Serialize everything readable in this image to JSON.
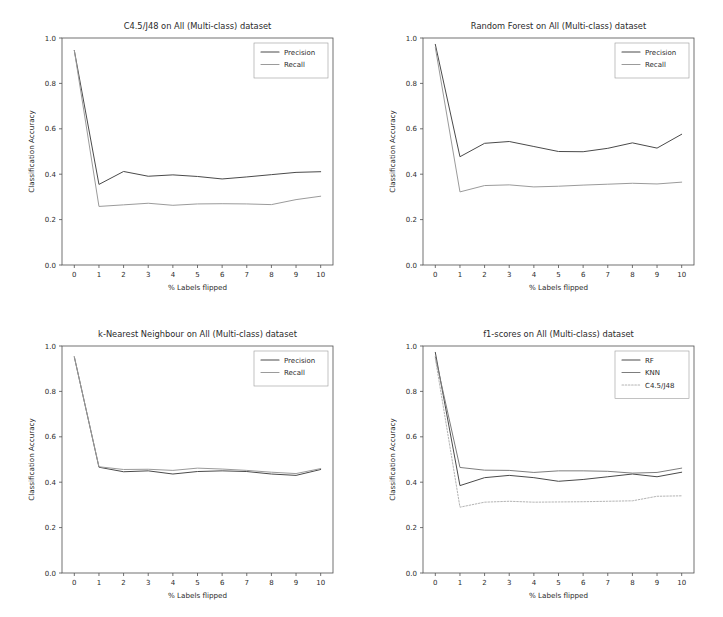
{
  "figure": {
    "background_color": "#ffffff",
    "rows": 2,
    "cols": 2
  },
  "axis": {
    "xlabel": "% Labels flipped",
    "ylabel": "Classification Accuracy",
    "xticks": [
      "0",
      "1",
      "2",
      "3",
      "4",
      "5",
      "6",
      "7",
      "8",
      "9",
      "10"
    ],
    "yticks": [
      "0.0",
      "0.2",
      "0.4",
      "0.6",
      "0.8",
      "1.0"
    ]
  },
  "colors": {
    "precision": "#4a4a4a",
    "recall": "#9b9b9b",
    "rf": "#4a4a4a",
    "knn": "#7d7d7d",
    "c45": "#b4b4b4",
    "spine": "#4f4f4f",
    "text": "#2b2b2b"
  },
  "chart_data": [
    {
      "type": "line",
      "title": "C4.5/J48 on All (Multi-class) dataset",
      "xlabel": "% Labels flipped",
      "ylabel": "Classification Accuracy",
      "x": [
        0,
        1,
        2,
        3,
        4,
        5,
        6,
        7,
        8,
        9,
        10
      ],
      "xlim": [
        -0.5,
        10.5
      ],
      "ylim": [
        0.0,
        1.0
      ],
      "grid": false,
      "legend_position": "upper right",
      "series": [
        {
          "name": "Precision",
          "color": "#4a4a4a",
          "style": "solid",
          "values": [
            0.945,
            0.355,
            0.412,
            0.391,
            0.397,
            0.39,
            0.379,
            0.388,
            0.398,
            0.408,
            0.411
          ]
        },
        {
          "name": "Recall",
          "color": "#9b9b9b",
          "style": "solid",
          "values": [
            0.945,
            0.258,
            0.265,
            0.272,
            0.263,
            0.269,
            0.27,
            0.269,
            0.266,
            0.288,
            0.303
          ]
        }
      ]
    },
    {
      "type": "line",
      "title": "Random Forest on All (Multi-class) dataset",
      "xlabel": "% Labels flipped",
      "ylabel": "Classification Accuracy",
      "x": [
        0,
        1,
        2,
        3,
        4,
        5,
        6,
        7,
        8,
        9,
        10
      ],
      "xlim": [
        -0.5,
        10.5
      ],
      "ylim": [
        0.0,
        1.0
      ],
      "grid": false,
      "legend_position": "upper right",
      "series": [
        {
          "name": "Precision",
          "color": "#4a4a4a",
          "style": "solid",
          "values": [
            0.972,
            0.477,
            0.536,
            0.544,
            0.522,
            0.5,
            0.499,
            0.514,
            0.538,
            0.515,
            0.576
          ]
        },
        {
          "name": "Recall",
          "color": "#9b9b9b",
          "style": "solid",
          "values": [
            0.958,
            0.322,
            0.35,
            0.353,
            0.344,
            0.347,
            0.352,
            0.356,
            0.36,
            0.357,
            0.365
          ]
        }
      ]
    },
    {
      "type": "line",
      "title": "k-Nearest Neighbour on All (Multi-class) dataset",
      "xlabel": "% Labels flipped",
      "ylabel": "Classification Accuracy",
      "x": [
        0,
        1,
        2,
        3,
        4,
        5,
        6,
        7,
        8,
        9,
        10
      ],
      "xlim": [
        -0.5,
        10.5
      ],
      "ylim": [
        0.0,
        1.0
      ],
      "grid": false,
      "legend_position": "upper right",
      "series": [
        {
          "name": "Precision",
          "color": "#4a4a4a",
          "style": "solid",
          "values": [
            0.952,
            0.466,
            0.446,
            0.45,
            0.436,
            0.447,
            0.45,
            0.447,
            0.436,
            0.43,
            0.456
          ]
        },
        {
          "name": "Recall",
          "color": "#9b9b9b",
          "style": "solid",
          "values": [
            0.952,
            0.468,
            0.456,
            0.457,
            0.452,
            0.462,
            0.458,
            0.452,
            0.444,
            0.438,
            0.46
          ]
        }
      ]
    },
    {
      "type": "line",
      "title": "f1-scores on All (Multi-class) dataset",
      "xlabel": "% Labels flipped",
      "ylabel": "Classification Accuracy",
      "x": [
        0,
        1,
        2,
        3,
        4,
        5,
        6,
        7,
        8,
        9,
        10
      ],
      "xlim": [
        -0.5,
        10.5
      ],
      "ylim": [
        0.0,
        1.0
      ],
      "grid": false,
      "legend_position": "upper right",
      "series": [
        {
          "name": "RF",
          "color": "#4a4a4a",
          "style": "solid",
          "values": [
            0.972,
            0.385,
            0.42,
            0.43,
            0.42,
            0.404,
            0.412,
            0.424,
            0.436,
            0.424,
            0.444
          ]
        },
        {
          "name": "KNN",
          "color": "#7d7d7d",
          "style": "solid",
          "values": [
            0.952,
            0.465,
            0.453,
            0.452,
            0.443,
            0.45,
            0.45,
            0.448,
            0.44,
            0.443,
            0.462
          ]
        },
        {
          "name": "C4.5/J48",
          "color": "#b4b4b4",
          "style": "dotted",
          "values": [
            0.945,
            0.29,
            0.312,
            0.316,
            0.312,
            0.313,
            0.314,
            0.316,
            0.318,
            0.338,
            0.34
          ]
        }
      ]
    }
  ]
}
